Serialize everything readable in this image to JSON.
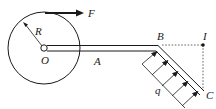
{
  "diagram": {
    "labels": {
      "force": "F",
      "radius": "R",
      "center": "O",
      "pointA": "A",
      "pointB": "B",
      "pointI": "I",
      "pointC": "C",
      "load": "q"
    },
    "colors": {
      "line": "#1a1a1a",
      "dashed": "#555555"
    }
  }
}
